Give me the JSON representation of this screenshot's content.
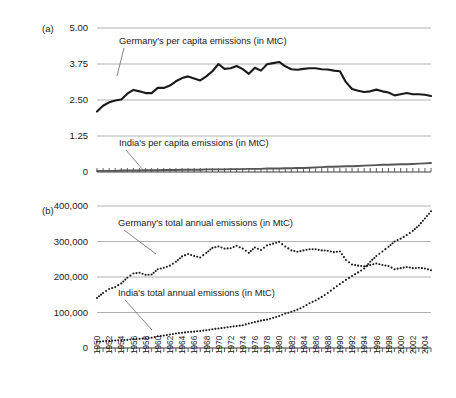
{
  "figure": {
    "panel_a_letter": "(a)",
    "panel_b_letter": "(b)"
  },
  "annotations": {
    "germany_per_capita": "Germany's per capita emissions (in MtC)",
    "india_per_capita": "India's per capita emissions (in MtC)",
    "germany_total": "Germany's total annual emissions (in MtC)",
    "india_total": "India's total annual emissions (in MtC)"
  },
  "colors": {
    "line_dark": "#1a1a1a",
    "line_gray": "#555555",
    "gridline": "#a8a8a8",
    "axis": "#3a3a3a",
    "background": "#ffffff"
  },
  "chart_data": [
    {
      "type": "line",
      "panel": "(a)",
      "title": "",
      "xlabel": "",
      "ylabel": "",
      "ylim": [
        0,
        5
      ],
      "yticks": [
        0,
        1.25,
        2.5,
        3.75,
        5
      ],
      "ytick_labels": [
        "0",
        "1.25",
        "2.50",
        "3.75",
        "5.00"
      ],
      "grid": true,
      "legend_position": "inline-annotation",
      "x": [
        1950,
        1951,
        1952,
        1953,
        1954,
        1955,
        1956,
        1957,
        1958,
        1959,
        1960,
        1961,
        1962,
        1963,
        1964,
        1965,
        1966,
        1967,
        1968,
        1969,
        1970,
        1971,
        1972,
        1973,
        1974,
        1975,
        1976,
        1977,
        1978,
        1979,
        1980,
        1981,
        1982,
        1983,
        1984,
        1985,
        1986,
        1987,
        1988,
        1989,
        1990,
        1991,
        1992,
        1993,
        1994,
        1995,
        1996,
        1997,
        1998,
        1999,
        2000,
        2001,
        2002,
        2003,
        2004,
        2005
      ],
      "series": [
        {
          "name": "Germany's per capita emissions (in MtC)",
          "style": "solid-thick-black",
          "values": [
            2.1,
            2.3,
            2.42,
            2.48,
            2.52,
            2.72,
            2.85,
            2.8,
            2.74,
            2.74,
            2.92,
            2.92,
            3.0,
            3.15,
            3.26,
            3.32,
            3.25,
            3.18,
            3.32,
            3.5,
            3.75,
            3.58,
            3.6,
            3.68,
            3.57,
            3.41,
            3.62,
            3.52,
            3.74,
            3.78,
            3.82,
            3.67,
            3.57,
            3.55,
            3.58,
            3.6,
            3.6,
            3.57,
            3.56,
            3.52,
            3.5,
            3.12,
            2.88,
            2.82,
            2.78,
            2.8,
            2.86,
            2.8,
            2.76,
            2.66,
            2.7,
            2.74,
            2.7,
            2.7,
            2.68,
            2.64
          ]
        },
        {
          "name": "India's per capita emissions (in MtC)",
          "style": "solid-gray",
          "values": [
            0.04,
            0.04,
            0.04,
            0.04,
            0.05,
            0.05,
            0.05,
            0.05,
            0.06,
            0.06,
            0.06,
            0.07,
            0.07,
            0.07,
            0.08,
            0.08,
            0.08,
            0.08,
            0.09,
            0.09,
            0.09,
            0.09,
            0.1,
            0.1,
            0.1,
            0.11,
            0.11,
            0.11,
            0.12,
            0.12,
            0.12,
            0.13,
            0.13,
            0.14,
            0.14,
            0.15,
            0.16,
            0.17,
            0.18,
            0.18,
            0.19,
            0.2,
            0.2,
            0.21,
            0.22,
            0.23,
            0.24,
            0.25,
            0.25,
            0.26,
            0.27,
            0.27,
            0.28,
            0.29,
            0.3,
            0.31
          ]
        }
      ]
    },
    {
      "type": "scatter",
      "panel": "(b)",
      "title": "",
      "xlabel": "",
      "ylabel": "",
      "ylim": [
        0,
        400000
      ],
      "yticks": [
        0,
        100000,
        200000,
        300000,
        400000
      ],
      "ytick_labels": [
        "0",
        "100,000",
        "200,000",
        "300,000",
        "400,000"
      ],
      "grid": true,
      "legend_position": "inline-annotation",
      "xtick_labels": [
        "1950",
        "1952",
        "1954",
        "1956",
        "1958",
        "1960",
        "1962",
        "1964",
        "1966",
        "1968",
        "1970",
        "1972",
        "1974",
        "1976",
        "1978",
        "1980",
        "1982",
        "1984",
        "1986",
        "1988",
        "1990",
        "1992",
        "1994",
        "1996",
        "1998",
        "2000",
        "2002",
        "2004"
      ],
      "x": [
        1950,
        1951,
        1952,
        1953,
        1954,
        1955,
        1956,
        1957,
        1958,
        1959,
        1960,
        1961,
        1962,
        1963,
        1964,
        1965,
        1966,
        1967,
        1968,
        1969,
        1970,
        1971,
        1972,
        1973,
        1974,
        1975,
        1976,
        1977,
        1978,
        1979,
        1980,
        1981,
        1982,
        1983,
        1984,
        1985,
        1986,
        1987,
        1988,
        1989,
        1990,
        1991,
        1992,
        1993,
        1994,
        1995,
        1996,
        1997,
        1998,
        1999,
        2000,
        2001,
        2002,
        2003,
        2004,
        2005
      ],
      "series": [
        {
          "name": "Germany's total annual emissions (in MtC)",
          "style": "dotted-black",
          "values": [
            141000,
            155000,
            166000,
            172000,
            182000,
            198000,
            210000,
            212000,
            206000,
            207000,
            222000,
            226000,
            232000,
            243000,
            258000,
            265000,
            259000,
            255000,
            268000,
            282000,
            286000,
            280000,
            281000,
            288000,
            280000,
            268000,
            283000,
            276000,
            289000,
            294000,
            299000,
            286000,
            275000,
            271000,
            275000,
            278000,
            278000,
            275000,
            274000,
            270000,
            272000,
            248000,
            235000,
            232000,
            230000,
            234000,
            238000,
            234000,
            231000,
            222000,
            225000,
            228000,
            225000,
            226000,
            224000,
            219000
          ]
        },
        {
          "name": "India's total annual emissions (in MtC)",
          "style": "dotted-black",
          "values": [
            18000,
            19000,
            20000,
            21000,
            22000,
            23000,
            25000,
            26000,
            27000,
            29000,
            33000,
            35000,
            38000,
            41000,
            43000,
            45000,
            46000,
            48000,
            50000,
            53000,
            55000,
            57000,
            60000,
            62000,
            64000,
            69000,
            73000,
            77000,
            80000,
            85000,
            90000,
            97000,
            102000,
            108000,
            116000,
            126000,
            134000,
            144000,
            155000,
            168000,
            180000,
            192000,
            203000,
            213000,
            224000,
            243000,
            259000,
            272000,
            285000,
            300000,
            308000,
            318000,
            330000,
            345000,
            365000,
            385000
          ]
        }
      ]
    }
  ]
}
